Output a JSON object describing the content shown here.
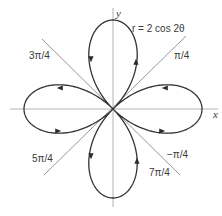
{
  "figure": {
    "equation_label": "r = 2 cos 2θ",
    "axes": {
      "x_label": "x",
      "y_label": "y"
    },
    "angle_labels": {
      "pi_over_4": "π/4",
      "three_pi_over_4": "3π/4",
      "five_pi_over_4": "5π/4",
      "seven_pi_over_4": "7π/4",
      "neg_pi_over_4": "−π/4"
    },
    "curve": {
      "type": "polar-rose",
      "equation": "r = 2 cos 2θ",
      "amplitude": 2,
      "k": 2,
      "petals": 4,
      "color": "#333333"
    },
    "guide_lines": [
      {
        "angle": "π/4",
        "color": "#8c8c8c"
      },
      {
        "angle": "3π/4",
        "color": "#8c8c8c"
      }
    ],
    "arrows": [
      {
        "lobe": "top",
        "side": "left",
        "direction": "down"
      },
      {
        "lobe": "top",
        "side": "right",
        "direction": "up"
      },
      {
        "lobe": "left",
        "side": "top",
        "direction": "left"
      },
      {
        "lobe": "left",
        "side": "bottom",
        "direction": "right"
      },
      {
        "lobe": "right",
        "side": "top",
        "direction": "left"
      },
      {
        "lobe": "right",
        "side": "bottom",
        "direction": "right"
      },
      {
        "lobe": "bottom",
        "side": "left",
        "direction": "down"
      },
      {
        "lobe": "bottom",
        "side": "right",
        "direction": "up"
      }
    ]
  }
}
